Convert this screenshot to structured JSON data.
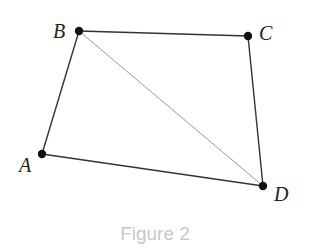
{
  "figure": {
    "caption": "Figure 2",
    "points": {
      "A": {
        "label": "A",
        "x": 42,
        "y": 154
      },
      "B": {
        "label": "B",
        "x": 79,
        "y": 31
      },
      "C": {
        "label": "C",
        "x": 248,
        "y": 36
      },
      "D": {
        "label": "D",
        "x": 263,
        "y": 186
      }
    },
    "edges": [
      "AB",
      "BC",
      "CD",
      "DA"
    ],
    "diagonals": [
      "BD"
    ],
    "colors": {
      "edge": "#333333",
      "diagonal": "#9a9a9a",
      "point": "#111111",
      "caption": "#c8c8c8"
    }
  }
}
